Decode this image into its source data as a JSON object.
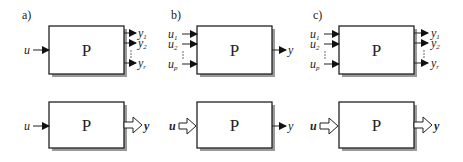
{
  "figure": {
    "panels": [
      {
        "id": "a",
        "label": "a)",
        "top": {
          "block": "P",
          "input": "u",
          "outputs": [
            {
              "base": "y",
              "sub": "1"
            },
            {
              "base": "y",
              "sub": "2"
            },
            {
              "base": "y",
              "sub": "r"
            }
          ]
        },
        "bottom": {
          "block": "P",
          "input": "u",
          "output": "y",
          "output_style": "vector-hollow-arrow"
        }
      },
      {
        "id": "b",
        "label": "b)",
        "top": {
          "block": "P",
          "inputs": [
            {
              "base": "u",
              "sub": "1"
            },
            {
              "base": "u",
              "sub": "2"
            },
            {
              "base": "u",
              "sub": "p"
            }
          ],
          "output": "y"
        },
        "bottom": {
          "block": "P",
          "input": "u",
          "input_style": "vector-hollow-arrow",
          "output": "y"
        }
      },
      {
        "id": "c",
        "label": "c)",
        "top": {
          "block": "P",
          "inputs": [
            {
              "base": "u",
              "sub": "1"
            },
            {
              "base": "u",
              "sub": "2"
            },
            {
              "base": "u",
              "sub": "p"
            }
          ],
          "outputs": [
            {
              "base": "y",
              "sub": "1"
            },
            {
              "base": "y",
              "sub": "2"
            },
            {
              "base": "y",
              "sub": "r"
            }
          ]
        },
        "bottom": {
          "block": "P",
          "input": "u",
          "input_style": "vector-hollow-arrow",
          "output": "y",
          "output_style": "vector-hollow-arrow"
        }
      }
    ],
    "colors": {
      "stroke": "#222222",
      "shadow": "#9a9a9a",
      "background": "#ffffff"
    }
  }
}
